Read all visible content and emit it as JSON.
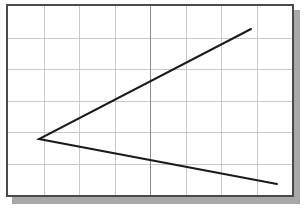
{
  "figure": {
    "title": "",
    "background_color": "#ffffff",
    "frame_color": "#4a4a4a",
    "shadow_color": "#a8a8a8",
    "grid_color": "#c9c9c9",
    "axis_color": "#8a8a8a",
    "line_color": "#1a1a1a"
  },
  "chart_data": {
    "type": "line",
    "title": "",
    "subtitle": "",
    "xlabel": "",
    "ylabel": "",
    "xlim": [
      0,
      8
    ],
    "ylim": [
      0,
      6
    ],
    "grid": true,
    "grid_columns": 8,
    "grid_rows": 6,
    "legend": null,
    "legend_position": "none",
    "tick_labels_x": [],
    "tick_labels_y": [],
    "annotations": [],
    "series": [
      {
        "name": "angle-polyline",
        "color": "#1a1a1a",
        "line_width": 2,
        "x": [
          6.9,
          0.8,
          7.6
        ],
        "y": [
          5.2,
          2.0,
          0.5
        ],
        "points_px": [
          {
            "x": 247,
            "y": 25
          },
          {
            "x": 35,
            "y": 135
          },
          {
            "x": 273,
            "y": 180
          }
        ]
      }
    ]
  }
}
